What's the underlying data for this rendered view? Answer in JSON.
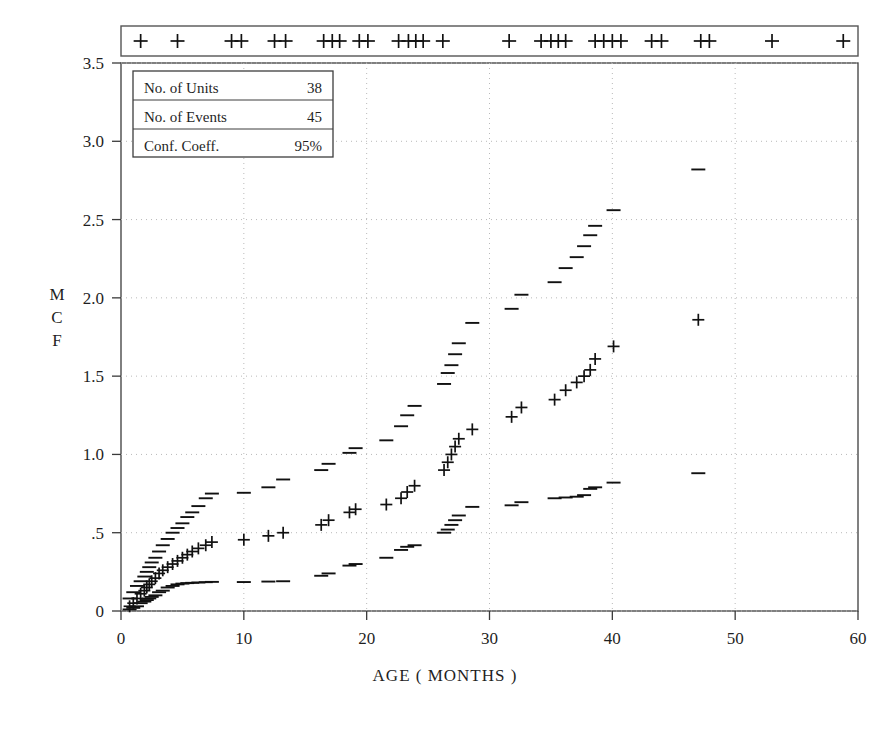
{
  "chart_data": {
    "type": "scatter",
    "title": "",
    "xlabel": "AGE ( MONTHS )",
    "ylabel": "MCF",
    "ylabel_chars": [
      "M",
      "C",
      "F"
    ],
    "xlim": [
      0,
      60
    ],
    "ylim": [
      0,
      3.5
    ],
    "xticks": [
      0,
      10,
      20,
      30,
      40,
      50,
      60
    ],
    "xtick_labels": [
      "0",
      "10",
      "20",
      "30",
      "40",
      "50",
      "60"
    ],
    "yticks": [
      0,
      0.5,
      1.0,
      1.5,
      2.0,
      2.5,
      3.0,
      3.5
    ],
    "ytick_labels": [
      "0",
      ".5",
      "1.0",
      "1.5",
      "2.0",
      "2.5",
      "3.0",
      "3.5"
    ],
    "grid": true,
    "grid_style": "dotted",
    "grid_color": "#b9b9b9",
    "marker_color": "#111111",
    "legend_position": "none",
    "series": [
      {
        "name": "MCF Estimate",
        "marker": "plus",
        "x": [
          0.7,
          1.0,
          1.3,
          1.6,
          1.9,
          2.1,
          2.3,
          2.5,
          2.8,
          3.1,
          3.4,
          3.8,
          4.2,
          4.6,
          5.0,
          5.4,
          5.8,
          6.3,
          6.9,
          7.4,
          10.0,
          12.0,
          13.2,
          16.3,
          16.9,
          18.6,
          19.1,
          21.6,
          22.8,
          23.3,
          23.9,
          26.3,
          26.6,
          26.9,
          27.2,
          27.5,
          28.6,
          31.8,
          32.6,
          35.3,
          36.2,
          37.1,
          37.7,
          38.2,
          38.6,
          40.1,
          47.0
        ],
        "y": [
          0.03,
          0.05,
          0.08,
          0.11,
          0.13,
          0.15,
          0.17,
          0.19,
          0.21,
          0.24,
          0.26,
          0.28,
          0.3,
          0.32,
          0.34,
          0.36,
          0.38,
          0.4,
          0.42,
          0.44,
          0.455,
          0.48,
          0.5,
          0.55,
          0.58,
          0.63,
          0.65,
          0.68,
          0.72,
          0.76,
          0.8,
          0.9,
          0.95,
          1.0,
          1.05,
          1.1,
          1.16,
          1.24,
          1.3,
          1.35,
          1.41,
          1.46,
          1.5,
          1.54,
          1.61,
          1.69,
          1.86
        ]
      },
      {
        "name": "Upper 95% Confidence Limit",
        "marker": "dash",
        "x": [
          0.7,
          1.0,
          1.3,
          1.6,
          1.9,
          2.1,
          2.3,
          2.5,
          2.8,
          3.1,
          3.4,
          3.8,
          4.2,
          4.6,
          5.0,
          5.4,
          5.8,
          6.3,
          6.9,
          7.4,
          10.0,
          12.0,
          13.2,
          16.3,
          16.9,
          18.6,
          19.1,
          21.6,
          22.8,
          23.3,
          23.9,
          26.3,
          26.6,
          26.9,
          27.2,
          27.5,
          28.6,
          31.8,
          32.6,
          35.3,
          36.2,
          37.1,
          37.7,
          38.2,
          38.6,
          40.1,
          47.0
        ],
        "y": [
          0.08,
          0.12,
          0.16,
          0.19,
          0.22,
          0.25,
          0.28,
          0.31,
          0.34,
          0.38,
          0.42,
          0.46,
          0.5,
          0.53,
          0.56,
          0.6,
          0.63,
          0.67,
          0.72,
          0.75,
          0.755,
          0.79,
          0.84,
          0.9,
          0.94,
          1.01,
          1.04,
          1.09,
          1.18,
          1.25,
          1.31,
          1.45,
          1.52,
          1.57,
          1.64,
          1.71,
          1.84,
          1.93,
          2.02,
          2.1,
          2.19,
          2.26,
          2.33,
          2.4,
          2.46,
          2.56,
          2.82
        ]
      },
      {
        "name": "Lower 95% Confidence Limit",
        "marker": "dash",
        "x": [
          0.7,
          1.0,
          1.3,
          1.6,
          1.9,
          2.1,
          2.3,
          2.5,
          2.8,
          3.1,
          3.4,
          3.8,
          4.2,
          4.6,
          5.0,
          5.4,
          5.8,
          6.3,
          6.9,
          7.4,
          10.0,
          12.0,
          13.2,
          16.3,
          16.9,
          18.6,
          19.1,
          21.6,
          22.8,
          23.3,
          23.9,
          26.3,
          26.6,
          26.9,
          27.2,
          27.5,
          28.6,
          31.8,
          32.6,
          35.3,
          36.2,
          37.1,
          37.7,
          38.2,
          38.6,
          40.1,
          47.0
        ],
        "y": [
          0.01,
          0.02,
          0.03,
          0.05,
          0.06,
          0.07,
          0.08,
          0.09,
          0.1,
          0.12,
          0.13,
          0.15,
          0.16,
          0.17,
          0.175,
          0.178,
          0.18,
          0.182,
          0.184,
          0.186,
          0.185,
          0.188,
          0.19,
          0.225,
          0.24,
          0.29,
          0.3,
          0.34,
          0.39,
          0.41,
          0.42,
          0.5,
          0.52,
          0.55,
          0.58,
          0.61,
          0.665,
          0.675,
          0.695,
          0.72,
          0.725,
          0.73,
          0.74,
          0.78,
          0.79,
          0.82,
          0.88
        ]
      }
    ],
    "censoring_marks": {
      "name": "Censoring Times",
      "marker": "plus",
      "x": [
        1.6,
        4.6,
        9.0,
        9.8,
        12.5,
        13.4,
        16.5,
        17.2,
        17.8,
        19.4,
        20.1,
        22.6,
        23.4,
        24.0,
        24.6,
        26.2,
        31.6,
        34.2,
        35.0,
        35.6,
        36.2,
        38.6,
        39.3,
        40.0,
        40.7,
        43.2,
        44.0,
        47.2,
        47.9,
        53.0,
        58.8
      ]
    }
  },
  "legend_box": {
    "rows": [
      {
        "label": "No. of Units",
        "value": "38"
      },
      {
        "label": "No. of Events",
        "value": "45"
      },
      {
        "label": "Conf. Coeff.",
        "value": "95%"
      }
    ]
  }
}
